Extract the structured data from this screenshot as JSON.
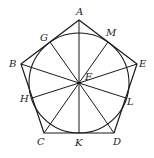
{
  "diagram": {
    "type": "geometry",
    "colors": {
      "stroke": "#1a1a1a",
      "label": "#222222",
      "background": "#ffffff"
    },
    "center": {
      "name": "F",
      "x": 79,
      "y": 83
    },
    "circle": {
      "cx": 79,
      "cy": 83,
      "r": 50
    },
    "vertices": [
      {
        "name": "A",
        "x": 79,
        "y": 20
      },
      {
        "name": "B",
        "x": 21,
        "y": 64
      },
      {
        "name": "C",
        "x": 44,
        "y": 133
      },
      {
        "name": "D",
        "x": 114,
        "y": 133
      },
      {
        "name": "E",
        "x": 137,
        "y": 64
      }
    ],
    "tangent_points": [
      {
        "name": "G",
        "x": 50,
        "y": 42
      },
      {
        "name": "M",
        "x": 108,
        "y": 42
      },
      {
        "name": "H",
        "x": 32,
        "y": 98
      },
      {
        "name": "L",
        "x": 126,
        "y": 98
      },
      {
        "name": "K",
        "x": 79,
        "y": 133
      }
    ],
    "labels": [
      {
        "text": "A",
        "x": 76,
        "y": 15
      },
      {
        "text": "B",
        "x": 9,
        "y": 67
      },
      {
        "text": "C",
        "x": 37,
        "y": 145
      },
      {
        "text": "D",
        "x": 113,
        "y": 145
      },
      {
        "text": "E",
        "x": 139,
        "y": 67
      },
      {
        "text": "F",
        "x": 85,
        "y": 80
      },
      {
        "text": "G",
        "x": 40,
        "y": 41
      },
      {
        "text": "M",
        "x": 106,
        "y": 36
      },
      {
        "text": "H",
        "x": 20,
        "y": 102
      },
      {
        "text": "L",
        "x": 127,
        "y": 105
      },
      {
        "text": "K",
        "x": 75,
        "y": 146
      }
    ]
  }
}
